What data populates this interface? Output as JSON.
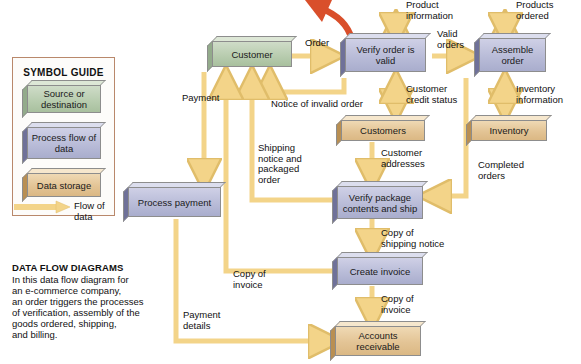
{
  "figure": {
    "caption_title": "DATA FLOW DIAGRAMS",
    "caption_body": "In this data flow diagram for\nan e-commerce company,\nan order triggers the processes\nof verification, assembly of the\ngoods ordered, shipping,\nand billing."
  },
  "legend": {
    "title": "SYMBOL GUIDE",
    "items": [
      {
        "label": "Source or\ndestination",
        "symbol": "source-destination",
        "color": "#b9cdb0"
      },
      {
        "label": "Process\nflow of data",
        "symbol": "process",
        "color": "#b9bcd8"
      },
      {
        "label": "Data storage",
        "symbol": "data-store",
        "color": "#e3c495"
      },
      {
        "label": "Flow of data",
        "symbol": "arrow",
        "color": "#f2d48a"
      }
    ]
  },
  "colors": {
    "source": "#b9cdb0",
    "process": "#b9bcd8",
    "store": "#e3c495",
    "flow": "#f3d489",
    "flow_dark": "#e8b73e",
    "highlight_arrow": "#d94f2b",
    "legend_border": "#b9886b",
    "background": "#ffffff"
  },
  "nodes": [
    {
      "id": "customer",
      "label": "Customer",
      "type": "source-destination"
    },
    {
      "id": "verify_order",
      "label": "Verify order\nis valid",
      "type": "process"
    },
    {
      "id": "assemble_order",
      "label": "Assemble\norder",
      "type": "process"
    },
    {
      "id": "customers",
      "label": "Customers",
      "type": "data-store"
    },
    {
      "id": "inventory",
      "label": "Inventory",
      "type": "data-store"
    },
    {
      "id": "process_payment",
      "label": "Process payment",
      "type": "process"
    },
    {
      "id": "verify_package",
      "label": "Verify package\ncontents and ship",
      "type": "process"
    },
    {
      "id": "create_invoice",
      "label": "Create invoice",
      "type": "process"
    },
    {
      "id": "accounts_recv",
      "label": "Accounts\nreceivable",
      "type": "data-store"
    }
  ],
  "flows": [
    {
      "id": "order",
      "label": "Order",
      "from": "customer",
      "to": "verify_order"
    },
    {
      "id": "product_information",
      "label": "Product\ninformation",
      "from": "verify_order",
      "to": "external",
      "arrow": "double"
    },
    {
      "id": "valid_orders",
      "label": "Valid\norders",
      "from": "verify_order",
      "to": "assemble_order"
    },
    {
      "id": "products_ordered",
      "label": "Products\nordered",
      "from": "assemble_order",
      "to": "external",
      "arrow": "double"
    },
    {
      "id": "customer_credit",
      "label": "Customer\ncredit status",
      "from": "verify_order",
      "to": "customers",
      "arrow": "double"
    },
    {
      "id": "inventory_info",
      "label": "Inventory\ninformation",
      "from": "assemble_order",
      "to": "inventory",
      "arrow": "double"
    },
    {
      "id": "notice_invalid",
      "label": "Notice of invalid order",
      "from": "verify_order",
      "to": "customer"
    },
    {
      "id": "payment",
      "label": "Payment",
      "from": "customer",
      "to": "process_payment"
    },
    {
      "id": "customer_addresses",
      "label": "Customer\naddresses",
      "from": "customers",
      "to": "verify_package"
    },
    {
      "id": "completed_orders",
      "label": "Completed\norders",
      "from": "assemble_order",
      "to": "verify_package"
    },
    {
      "id": "shipping_packaged",
      "label": "Shipping\nnotice and\npackaged\norder",
      "from": "verify_package",
      "to": "customer"
    },
    {
      "id": "copy_shipping",
      "label": "Copy of\nshipping notice",
      "from": "verify_package",
      "to": "create_invoice"
    },
    {
      "id": "copy_invoice_cust",
      "label": "Copy of\ninvoice",
      "from": "create_invoice",
      "to": "customer"
    },
    {
      "id": "copy_invoice_ar",
      "label": "Copy of\ninvoice",
      "from": "create_invoice",
      "to": "accounts_recv"
    },
    {
      "id": "payment_details",
      "label": "Payment\ndetails",
      "from": "process_payment",
      "to": "accounts_recv"
    }
  ]
}
